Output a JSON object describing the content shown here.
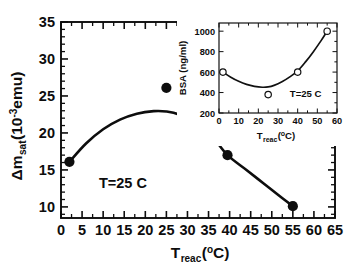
{
  "chart_data": [
    {
      "id": "main",
      "type": "scatter",
      "title": "",
      "xlabel": "T_reac(oC)",
      "xlabel_base": "T",
      "xlabel_sub": "reac",
      "xlabel_paren_open": "(",
      "xlabel_deg": "o",
      "xlabel_unit": "C)",
      "ylabel": "Δm_sat(10^-3 emu)",
      "ylabel_delta": "Δm",
      "ylabel_sub": "sat",
      "ylabel_mid": "(10",
      "ylabel_sup": "-3",
      "ylabel_end": "emu)",
      "xlim": [
        0,
        65
      ],
      "ylim": [
        8.5,
        35
      ],
      "xticks": [
        0,
        5,
        10,
        15,
        20,
        25,
        30,
        35,
        40,
        45,
        50,
        55,
        60,
        65
      ],
      "xtick_labels": [
        "0",
        "5",
        "10",
        "15",
        "20",
        "25",
        "30",
        "35",
        "40",
        "45",
        "50",
        "55",
        "60",
        "65"
      ],
      "yticks": [
        10,
        15,
        20,
        25,
        30,
        35
      ],
      "ytick_labels": [
        "10",
        "15",
        "20",
        "25",
        "30",
        "35"
      ],
      "y_minor_step": 1,
      "grid": false,
      "legend": "none",
      "annotation": "T=25 C",
      "annotation_x": 9,
      "annotation_y": 12.6,
      "marker": "filled-circle",
      "points": [
        {
          "x": 2,
          "y": 16.1
        },
        {
          "x": 25,
          "y": 26.1
        },
        {
          "x": 39.5,
          "y": 17.0
        },
        {
          "x": 55,
          "y": 10.1
        }
      ],
      "fit_curve": [
        {
          "x": 2,
          "y": 16.1
        },
        {
          "x": 6,
          "y": 18.6
        },
        {
          "x": 10,
          "y": 20.5
        },
        {
          "x": 14,
          "y": 21.8
        },
        {
          "x": 18,
          "y": 22.6
        },
        {
          "x": 22,
          "y": 22.95
        },
        {
          "x": 25,
          "y": 22.9
        },
        {
          "x": 28,
          "y": 22.5
        },
        {
          "x": 32,
          "y": 21.3
        },
        {
          "x": 36,
          "y": 19.4
        },
        {
          "x": 39.5,
          "y": 17.0
        },
        {
          "x": 44,
          "y": 15.0
        },
        {
          "x": 48,
          "y": 13.2
        },
        {
          "x": 52,
          "y": 11.4
        },
        {
          "x": 55,
          "y": 10.1
        }
      ]
    },
    {
      "id": "inset",
      "type": "scatter",
      "title": "",
      "xlabel": "T_reac(oC)",
      "xlabel_base": "T",
      "xlabel_sub": "reac",
      "xlabel_paren_open": "(",
      "xlabel_deg": "o",
      "xlabel_unit": "C)",
      "ylabel": "BSA (ng/ml)",
      "xlim": [
        0,
        60
      ],
      "ylim": [
        200,
        1080
      ],
      "xticks": [
        0,
        10,
        20,
        30,
        40,
        50,
        60
      ],
      "xtick_labels": [
        "0",
        "10",
        "20",
        "30",
        "40",
        "50",
        "60"
      ],
      "yticks": [
        200,
        400,
        600,
        800,
        1000
      ],
      "ytick_labels": [
        "200",
        "400",
        "600",
        "800",
        "1000"
      ],
      "grid": false,
      "legend": "none",
      "annotation": "T=25 C",
      "annotation_x": 36,
      "annotation_y": 360,
      "marker": "open-circle",
      "points": [
        {
          "x": 2,
          "y": 600
        },
        {
          "x": 25,
          "y": 380
        },
        {
          "x": 40,
          "y": 600
        },
        {
          "x": 55,
          "y": 1000
        }
      ],
      "fit_curve": [
        {
          "x": 2,
          "y": 600
        },
        {
          "x": 6,
          "y": 550
        },
        {
          "x": 10,
          "y": 510
        },
        {
          "x": 14,
          "y": 480
        },
        {
          "x": 18,
          "y": 461
        },
        {
          "x": 22,
          "y": 452
        },
        {
          "x": 25,
          "y": 455
        },
        {
          "x": 28,
          "y": 470
        },
        {
          "x": 32,
          "y": 505
        },
        {
          "x": 36,
          "y": 553
        },
        {
          "x": 40,
          "y": 612
        },
        {
          "x": 44,
          "y": 700
        },
        {
          "x": 48,
          "y": 800
        },
        {
          "x": 52,
          "y": 910
        },
        {
          "x": 55,
          "y": 1000
        }
      ]
    }
  ]
}
